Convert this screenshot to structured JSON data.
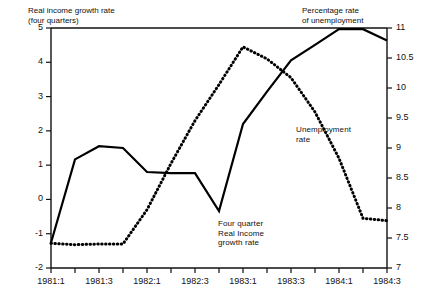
{
  "chart_data": {
    "type": "line",
    "title": "",
    "annotations": [
      {
        "name": "left-axis-title",
        "text": "Real income growth rate\n(four quarters)",
        "x": 28,
        "y": 6
      },
      {
        "name": "right-axis-title",
        "text": "Percentage rate\nof unemployment",
        "x": 302,
        "y": 6
      },
      {
        "name": "unemployment-series-label",
        "text": "Unemployment\nrate",
        "x": 296,
        "y": 125
      },
      {
        "name": "real-income-series-label",
        "text": "Four quarter\nReal Income\ngrowth rate",
        "x": 218,
        "y": 219
      }
    ],
    "x": [
      "1981:1",
      "1981:2",
      "1981:3",
      "1981:4",
      "1982:1",
      "1982:2",
      "1982:3",
      "1982:4",
      "1983:1",
      "1983:2",
      "1983:3",
      "1983:4",
      "1984:1",
      "1984:2",
      "1984:3"
    ],
    "xtick_labels": [
      "1981:1",
      "1981:3",
      "1982:1",
      "1982:3",
      "1983:1",
      "1983:3",
      "1984:1",
      "1984:3"
    ],
    "xlabel": "",
    "grid": false,
    "legend_position": "inline-annotations",
    "left_axis": {
      "label": "Real income growth rate (four quarters)",
      "ylim": [
        -2,
        5
      ],
      "ticks": [
        "5",
        "4",
        "3",
        "2",
        "1",
        "0",
        "-1",
        "-2"
      ],
      "tick_values": [
        5,
        4,
        3,
        2,
        1,
        0,
        -1,
        -2
      ]
    },
    "right_axis": {
      "label": "Percentage rate of unemployment",
      "ylim": [
        7,
        11
      ],
      "ticks": [
        "11",
        "10.5",
        "10",
        "9.5",
        "9",
        "8.5",
        "8",
        "7.5",
        "7"
      ],
      "tick_values": [
        11,
        10.5,
        10,
        9.5,
        9,
        8.5,
        8,
        7.5,
        7
      ]
    },
    "series": [
      {
        "name": "Unemployment rate",
        "axis": "right",
        "style": "solid",
        "color": "#000000",
        "values": [
          7.42,
          8.81,
          9.03,
          9.0,
          8.6,
          8.58,
          8.58,
          7.95,
          9.4,
          9.94,
          10.46,
          10.72,
          10.98,
          10.98,
          10.79
        ]
      },
      {
        "name": "Four quarter Real Income growth rate",
        "axis": "left",
        "style": "dotted",
        "color": "#000000",
        "values": [
          -1.28,
          -1.32,
          -1.3,
          -1.3,
          -0.3,
          1.05,
          2.3,
          3.35,
          4.45,
          4.1,
          3.55,
          2.55,
          1.2,
          -0.55,
          -0.62
        ]
      }
    ]
  }
}
